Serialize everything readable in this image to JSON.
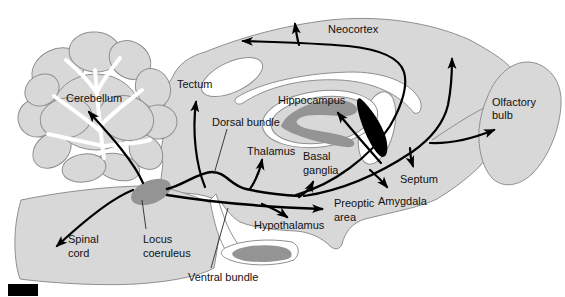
{
  "figure": {
    "type": "rat-brain-sagittal-noradrenergic-pathways-diagram",
    "labels": {
      "neocortex": "Neocortex",
      "cerebellum": "Cerebellum",
      "tectum": "Tectum",
      "hippocampus": "Hippocampus",
      "olfactory_bulb_line1": "Olfactory",
      "olfactory_bulb_line2": "bulb",
      "dorsal_bundle": "Dorsal bundle",
      "thalamus": "Thalamus",
      "basal_ganglia_line1": "Basal",
      "basal_ganglia_line2": "ganglia",
      "septum": "Septum",
      "amygdala": "Amygdala",
      "preoptic_area_line1": "Preoptic",
      "preoptic_area_line2": "area",
      "hypothalamus": "Hypothalamus",
      "spinal_cord_line1": "Spinal",
      "spinal_cord_line2": "cord",
      "locus_coeruleus_line1": "Locus",
      "locus_coeruleus_line2": "coeruleus",
      "ventral_bundle": "Ventral bundle"
    },
    "colors": {
      "background": "#ffffff",
      "brain_fill": "#d8d8d8",
      "outline": "#8f8f8f",
      "structure_gray": "#949494",
      "pathway_black": "#000000",
      "label_text": "#111111"
    }
  }
}
